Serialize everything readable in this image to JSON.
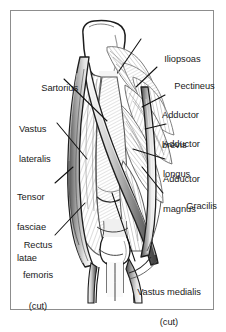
{
  "figure": {
    "frame_color": "#8d8d8d",
    "background_color": "#ffffff",
    "ink_color": "#1a1a1a",
    "muscle_fill_color": "#d9d9d9",
    "hatch_color": "#9a9a9a",
    "bone_fill_color": "#ffffff"
  },
  "labels": [
    {
      "id": "iliopsoas",
      "text": "Iliopsoas",
      "align": "left"
    },
    {
      "id": "pectineus",
      "text": "Pectineus",
      "align": "left"
    },
    {
      "id": "adductor-brevis",
      "text": "Adductor\nbrevis",
      "align": "left"
    },
    {
      "id": "adductor-longus",
      "text": "Adductor\nlongus",
      "align": "left"
    },
    {
      "id": "adductor-magnus",
      "text": "Adductor\nmagnus",
      "align": "left"
    },
    {
      "id": "gracilis",
      "text": "Gracilis",
      "align": "left"
    },
    {
      "id": "vastus-medialis",
      "text": "Vastus medialis\n(cut)",
      "align": "center"
    },
    {
      "id": "sartorius",
      "text": "Sartorius",
      "align": "right"
    },
    {
      "id": "vastus-lateralis",
      "text": "Vastus\nlateralis",
      "align": "left"
    },
    {
      "id": "tensor-fasciae-latae",
      "text": "Tensor\nfasciae\nlatae",
      "align": "left"
    },
    {
      "id": "rectus-femoris",
      "text": "Rectus\nfemoris\n(cut)",
      "align": "center"
    }
  ],
  "label_text": {
    "iliopsoas": "Iliopsoas",
    "pectineus": "Pectineus",
    "adductor_brevis_l1": "Adductor",
    "adductor_brevis_l2": "brevis",
    "adductor_longus_l1": "Adductor",
    "adductor_longus_l2": "longus",
    "adductor_magnus_l1": "Adductor",
    "adductor_magnus_l2": "magnus",
    "gracilis": "Gracilis",
    "vastus_medialis_l1": "Vastus medialis",
    "vastus_medialis_l2": "(cut)",
    "sartorius": "Sartorius",
    "vastus_lateralis_l1": "Vastus",
    "vastus_lateralis_l2": "lateralis",
    "tensor_fasciae_latae_l1": "Tensor",
    "tensor_fasciae_latae_l2": "fasciae",
    "tensor_fasciae_latae_l3": "latae",
    "rectus_femoris_l1": "Rectus",
    "rectus_femoris_l2": "femoris",
    "rectus_femoris_l3": "(cut)"
  }
}
